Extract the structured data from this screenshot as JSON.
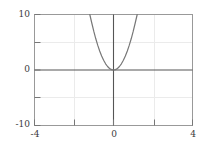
{
  "chart_data": {
    "type": "line",
    "title": "",
    "xlabel": "",
    "ylabel": "",
    "xlim": [
      -4,
      4
    ],
    "ylim": [
      -10,
      10
    ],
    "grid": true,
    "legend": null,
    "axis_lines": {
      "x_axis_at_y": 0,
      "y_axis_at_x": 0
    },
    "x_ticks": [
      -4,
      -2,
      0,
      2,
      4
    ],
    "x_tick_labels": [
      "-4",
      "",
      "0",
      "",
      "4"
    ],
    "y_ticks": [
      -10,
      -5,
      0,
      5,
      10
    ],
    "y_tick_labels": [
      "-10",
      "",
      "0",
      "",
      "10"
    ],
    "series": [
      {
        "name": "curve",
        "expression": "y = 7x^2",
        "color": "#777777",
        "x": [
          -1.2,
          -1.1,
          -1.0,
          -0.9,
          -0.8,
          -0.7,
          -0.6,
          -0.5,
          -0.4,
          -0.3,
          -0.2,
          -0.1,
          0.0,
          0.1,
          0.2,
          0.3,
          0.4,
          0.5,
          0.6,
          0.7,
          0.8,
          0.9,
          1.0,
          1.1,
          1.2
        ],
        "values": [
          10.0,
          8.47,
          7.0,
          5.67,
          4.48,
          3.43,
          2.52,
          1.75,
          1.12,
          0.63,
          0.28,
          0.07,
          0.0,
          0.07,
          0.28,
          0.63,
          1.12,
          1.75,
          2.52,
          3.43,
          4.48,
          5.67,
          7.0,
          8.47,
          10.0
        ]
      }
    ]
  },
  "labels": {
    "y_top": "10",
    "y_mid": "0",
    "y_bottom": "-10",
    "x_left": "-4",
    "x_mid": "0",
    "x_right": "4"
  },
  "colors": {
    "curve": "#777777",
    "axis": "#555555",
    "frame": "#888888",
    "grid": "#e8e8e8",
    "text": "#3a3a3a",
    "background": "#ffffff"
  }
}
